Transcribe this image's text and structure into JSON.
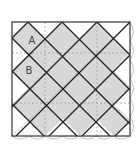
{
  "diagram": {
    "type": "tiling",
    "labels": [
      {
        "text": "A",
        "x": 32,
        "y": 44
      },
      {
        "text": "B",
        "x": 29,
        "y": 74
      }
    ],
    "colors": {
      "tile_fill": "#d8d8d8",
      "line": "#222222",
      "dashed": "#999999",
      "background": "#ffffff",
      "scallop": "#aaaaaa"
    },
    "square": {
      "x": 12,
      "y": 22,
      "w": 118,
      "h": 114
    }
  }
}
